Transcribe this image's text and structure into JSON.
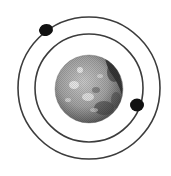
{
  "diagram": {
    "type": "planet-with-orbiting-moons",
    "planet": {
      "cx": 89,
      "cy": 89,
      "r": 34,
      "base_color": "#9a9a9a",
      "light_color": "#d8d8d8",
      "dark_color": "#3a3a3a"
    },
    "orbits": [
      {
        "name": "inner-orbit",
        "cx": 89,
        "cy": 88,
        "r": 54
      },
      {
        "name": "outer-orbit",
        "cx": 89,
        "cy": 88,
        "r": 71
      }
    ],
    "moons": [
      {
        "name": "outer-moon",
        "cx": 46,
        "cy": 30,
        "rx": 7,
        "ry": 6
      },
      {
        "name": "inner-moon",
        "cx": 137,
        "cy": 105,
        "rx": 7,
        "ry": 6.5
      }
    ],
    "colors": {
      "orbit_stroke": "#3c3c3c",
      "moon_fill": "#111111",
      "background": "#ffffff"
    }
  }
}
